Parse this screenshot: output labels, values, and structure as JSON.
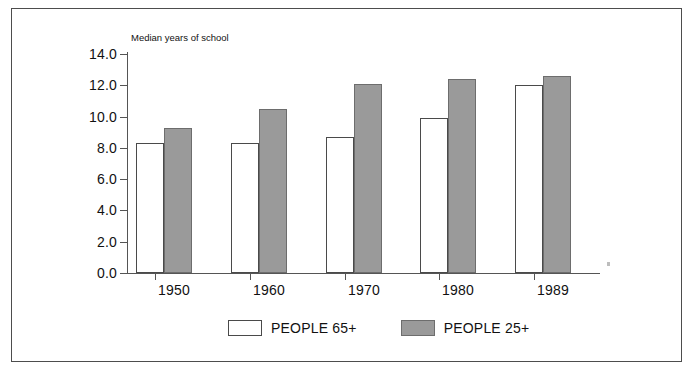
{
  "chart_data": {
    "type": "bar",
    "title": "",
    "subtitle": "",
    "xlabel": "",
    "ylabel": "Median years of school",
    "categories": [
      "1950",
      "1960",
      "1970",
      "1980",
      "1989"
    ],
    "series": [
      {
        "name": "PEOPLE 65+",
        "color": "#ffffff",
        "values": [
          8.3,
          8.3,
          8.7,
          9.9,
          12.0
        ]
      },
      {
        "name": "PEOPLE 25+",
        "color": "#9a9a9a",
        "values": [
          9.3,
          10.5,
          12.1,
          12.4,
          12.6
        ]
      }
    ],
    "ylim": [
      0.0,
      14.0
    ],
    "ytick_labels": [
      "14.0",
      "12.0",
      "10.0",
      "8.0",
      "6.0",
      "4.0",
      "2.0",
      "0.0"
    ],
    "ytick_values": [
      14.0,
      12.0,
      10.0,
      8.0,
      6.0,
      4.0,
      2.0,
      0.0
    ],
    "grid": false,
    "legend_position": "bottom-center"
  },
  "legend": {
    "items": [
      {
        "label": "PEOPLE 65+",
        "swatch": "white-swatch"
      },
      {
        "label": "PEOPLE 25+",
        "swatch": "gray-swatch"
      }
    ]
  }
}
